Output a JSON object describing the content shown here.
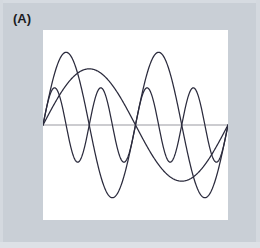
{
  "panel": {
    "label": "(A)"
  },
  "colors": {
    "border": "#c9cfd6",
    "plot_background": "#ffffff",
    "axis_line": "#9a9aa2",
    "curve": "#2b2b3d"
  },
  "chart_data": {
    "type": "line",
    "title": "",
    "subtitle": "",
    "xlabel": "",
    "ylabel": "",
    "xlim": [
      0,
      1
    ],
    "ylim": [
      -1.15,
      1.15
    ],
    "grid": false,
    "legend": "none",
    "axis_line_y": 0,
    "annotations": [
      "(A)"
    ],
    "series": [
      {
        "name": "harmonic-1",
        "waveform": "sine",
        "cycles": 1,
        "amplitude": 0.68,
        "phase": 0,
        "samples": 400
      },
      {
        "name": "harmonic-2",
        "waveform": "sine",
        "cycles": 2,
        "amplitude": 0.88,
        "phase": 0,
        "samples": 400
      },
      {
        "name": "harmonic-4",
        "waveform": "sine",
        "cycles": 4,
        "amplitude": 0.45,
        "phase": 0,
        "samples": 400
      }
    ]
  }
}
